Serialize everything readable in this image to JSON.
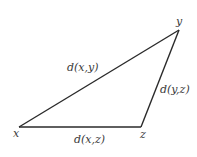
{
  "diagram": {
    "type": "triangle-inequality",
    "vertices": [
      {
        "id": "x",
        "label": "x",
        "pos": [
          19,
          127
        ],
        "label_pos": [
          13,
          137
        ]
      },
      {
        "id": "y",
        "label": "y",
        "pos": [
          179,
          30
        ],
        "label_pos": [
          176,
          25
        ]
      },
      {
        "id": "z",
        "label": "z",
        "pos": [
          141,
          127
        ],
        "label_pos": [
          140,
          138
        ]
      }
    ],
    "edges": [
      {
        "from": "x",
        "to": "y",
        "label": "d(x,y)",
        "label_pos": [
          67,
          71
        ]
      },
      {
        "from": "y",
        "to": "z",
        "label": "d(y,z)",
        "label_pos": [
          160,
          93
        ]
      },
      {
        "from": "x",
        "to": "z",
        "label": "d(x,z)",
        "label_pos": [
          74,
          143
        ]
      }
    ],
    "colors": {
      "line": "#2a2a2a",
      "text": "#3a3a3a",
      "background": "#ffffff"
    }
  }
}
